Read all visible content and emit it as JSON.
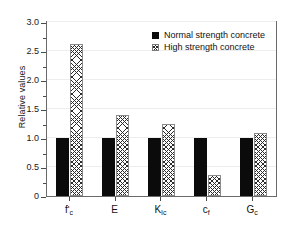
{
  "chart_data": {
    "type": "bar",
    "title": "",
    "xlabel": "",
    "ylabel": "Relative values",
    "ylim": [
      0,
      3.0
    ],
    "grid": true,
    "legend_position": "upper right (inside plot frame)",
    "categories": [
      "f'c",
      "E",
      "KIc",
      "cf",
      "Gc"
    ],
    "category_labels_rich": [
      {
        "base": "f",
        "prime": "'",
        "sub": "c"
      },
      {
        "base": "E",
        "prime": "",
        "sub": ""
      },
      {
        "base": "K",
        "prime": "",
        "sub": "Ic"
      },
      {
        "base": "c",
        "prime": "",
        "sub": "f"
      },
      {
        "base": "G",
        "prime": "",
        "sub": "c"
      }
    ],
    "series": [
      {
        "name": "Normal strength concrete",
        "fill": "solid-black",
        "color": "#0b0b0b",
        "values": [
          1.0,
          1.0,
          1.0,
          1.0,
          1.0
        ]
      },
      {
        "name": "High strength concrete",
        "fill": "cross-hatch",
        "color": "#ffffff",
        "values": [
          2.62,
          1.39,
          1.24,
          0.37,
          1.09
        ]
      }
    ],
    "y_ticks_major": [
      "0",
      "0.5",
      "1.0",
      "1.5",
      "2.0",
      "2.5",
      "3.0"
    ],
    "y_ticks_major_values": [
      0,
      0.5,
      1.0,
      1.5,
      2.0,
      2.5,
      3.0
    ],
    "y_ticks_minor_values": [
      0.25,
      0.75,
      1.25,
      1.75,
      2.25,
      2.75
    ]
  },
  "legend": {
    "items": [
      {
        "label": "Normal strength concrete"
      },
      {
        "label": "High strength concrete"
      }
    ]
  },
  "axis": {
    "y_title": "Relative values"
  }
}
